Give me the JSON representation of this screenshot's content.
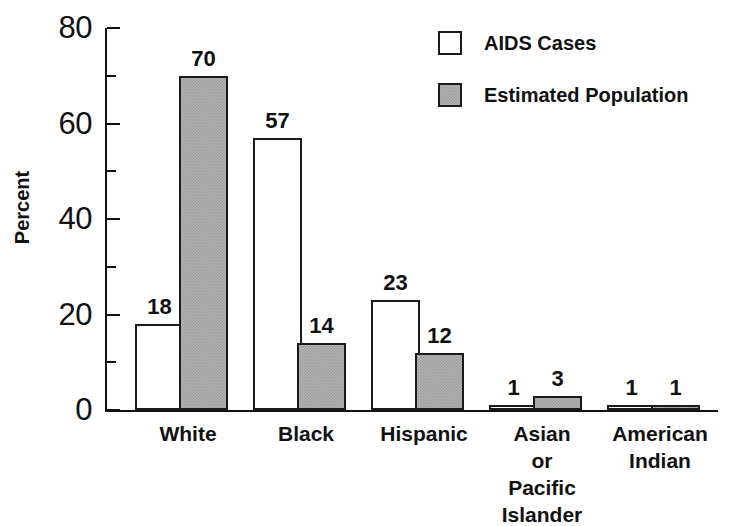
{
  "chart_data": {
    "type": "bar",
    "title": "",
    "xlabel": "",
    "ylabel": "Percent",
    "ylim": [
      0,
      80
    ],
    "yticks": [
      0,
      20,
      40,
      60,
      80
    ],
    "yminorticks": [
      10,
      30,
      50,
      70
    ],
    "grid": false,
    "legend_position": "top-right",
    "categories": [
      "White",
      "Black",
      "Hispanic",
      "Asian\nor\nPacific Islander",
      "American\nIndian"
    ],
    "series": [
      {
        "name": "AIDS Cases",
        "fill": "white",
        "values": [
          18,
          57,
          23,
          1,
          1
        ],
        "labels": [
          "18",
          "57",
          "23",
          "1",
          "1"
        ]
      },
      {
        "name": "Estimated Population",
        "fill": "gray-stipple",
        "values": [
          70,
          14,
          12,
          3,
          1
        ],
        "labels": [
          "70",
          "14",
          "12",
          "3",
          "1"
        ]
      }
    ]
  },
  "legend": {
    "items": [
      {
        "label": "AIDS Cases",
        "swatch": "white-square"
      },
      {
        "label": "Estimated Population",
        "swatch": "gray-square"
      }
    ]
  },
  "axis": {
    "y_label": "Percent",
    "y_tick_labels": [
      "80",
      "60",
      "40",
      "20",
      "0"
    ]
  },
  "colors": {
    "ink": "#111111",
    "bar_outline": "#1a1a1a",
    "bar_fill_cases": "#ffffff",
    "bar_fill_population": "#b4b4b4",
    "background": "#ffffff"
  }
}
